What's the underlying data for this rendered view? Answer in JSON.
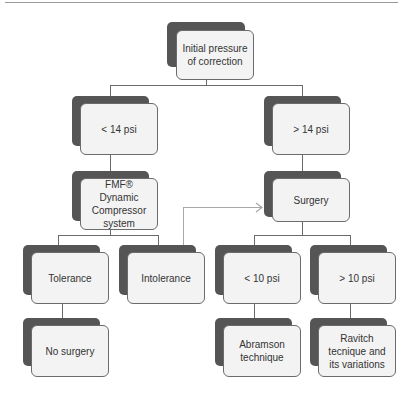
{
  "diagram": {
    "type": "flowchart",
    "nodes": {
      "root": "Initial pressure of correction",
      "left": "< 14 psi",
      "right": "> 14 psi",
      "fmf": "FMF® Dynamic Compressor system",
      "surgery": "Surgery",
      "tolerance": "Tolerance",
      "intolerance": "Intolerance",
      "lt10": "< 10 psi",
      "gt10": "> 10 psi",
      "nosurgery": "No surgery",
      "abramson": "Abramson technique",
      "ravitch": "Ravitch tecnique and its variations"
    },
    "edges": [
      [
        "root",
        "left"
      ],
      [
        "root",
        "right"
      ],
      [
        "left",
        "fmf"
      ],
      [
        "right",
        "surgery"
      ],
      [
        "fmf",
        "tolerance"
      ],
      [
        "fmf",
        "intolerance"
      ],
      [
        "intolerance",
        "surgery"
      ],
      [
        "surgery",
        "lt10"
      ],
      [
        "surgery",
        "gt10"
      ],
      [
        "tolerance",
        "nosurgery"
      ],
      [
        "lt10",
        "abramson"
      ],
      [
        "gt10",
        "ravitch"
      ]
    ],
    "colors": {
      "shadow": "#555555",
      "card": "#f3f3f3",
      "border": "#6b6b6b",
      "arrow": "#a8a8a8"
    }
  }
}
